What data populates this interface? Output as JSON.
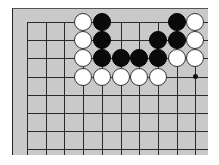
{
  "board": {
    "origin_x": 27,
    "origin_y": 22,
    "spacing_x": 18.7,
    "spacing_y": 18.2,
    "cols": 11,
    "rows": 8,
    "line_left": 27,
    "line_right": 208,
    "line_top": 22,
    "line_bottom": 155,
    "colors": {
      "board": "#c9c9c9",
      "line": "#2a2a2a",
      "black": "#0a0a0a",
      "white": "#ffffff"
    }
  },
  "stones": [
    {
      "color": "white",
      "col": 3,
      "row": 0
    },
    {
      "color": "black",
      "col": 4,
      "row": 0
    },
    {
      "color": "black",
      "col": 8,
      "row": 0
    },
    {
      "color": "white",
      "col": 9,
      "row": 0
    },
    {
      "color": "white",
      "col": 3,
      "row": 1
    },
    {
      "color": "black",
      "col": 4,
      "row": 1
    },
    {
      "color": "black",
      "col": 7,
      "row": 1
    },
    {
      "color": "black",
      "col": 8,
      "row": 1
    },
    {
      "color": "white",
      "col": 9,
      "row": 1
    },
    {
      "color": "white",
      "col": 3,
      "row": 2
    },
    {
      "color": "black",
      "col": 4,
      "row": 2
    },
    {
      "color": "black",
      "col": 5,
      "row": 2
    },
    {
      "color": "black",
      "col": 6,
      "row": 2
    },
    {
      "color": "black",
      "col": 7,
      "row": 2
    },
    {
      "color": "white",
      "col": 8,
      "row": 2
    },
    {
      "color": "white",
      "col": 9,
      "row": 2
    },
    {
      "color": "white",
      "col": 3,
      "row": 3
    },
    {
      "color": "white",
      "col": 4,
      "row": 3
    },
    {
      "color": "white",
      "col": 5,
      "row": 3
    },
    {
      "color": "white",
      "col": 6,
      "row": 3
    },
    {
      "color": "white",
      "col": 7,
      "row": 3
    }
  ],
  "star_points": [
    {
      "col": 9,
      "row": 3
    }
  ]
}
